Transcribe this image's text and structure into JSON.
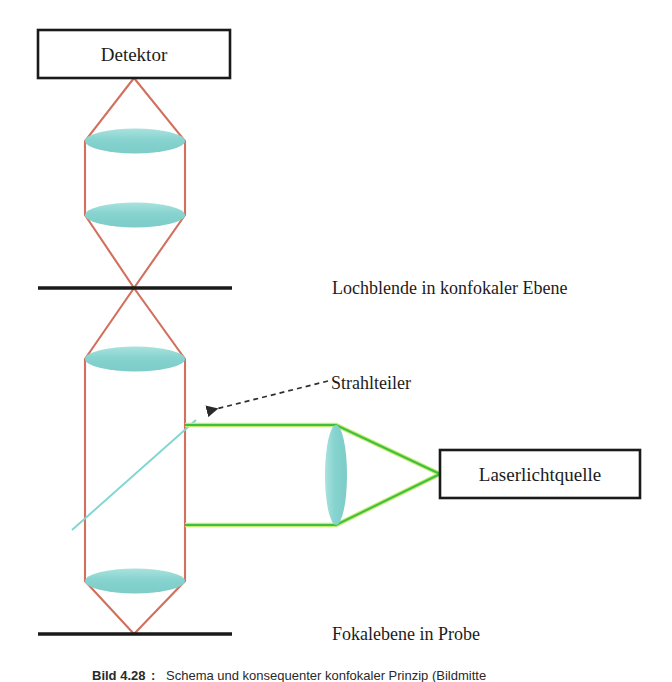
{
  "figure": {
    "title_alt": "Schema eines konfokalen Strahlengangs",
    "width": 672,
    "height": 682,
    "background": "#ffffff"
  },
  "colors": {
    "beam_detection": "#d2705e",
    "beam_illumination": "#3fbf3f",
    "beam_highlight": "#bde86a",
    "lens_fill": "#86d3cf",
    "lens_fill_light": "#a6e0dc",
    "beamsplitter": "#7fd6d2",
    "plane_line": "#1a1a1a",
    "box_stroke": "#1a1a1a",
    "leader_line": "#3a3a3a",
    "text": "#1c1c1c"
  },
  "boxes": [
    {
      "id": "detektor",
      "label": "Detektor",
      "x": 38,
      "y": 30,
      "width": 192,
      "height": 48
    },
    {
      "id": "laserlichtquelle",
      "label": "Laserlichtquelle",
      "x": 440,
      "y": 450,
      "width": 200,
      "height": 48
    }
  ],
  "planes": [
    {
      "id": "pinhole-plane",
      "label": "Lochblende in konfokaler Ebene",
      "x1": 38,
      "x2": 232,
      "y": 288,
      "label_x": 332,
      "label_y": 294
    },
    {
      "id": "focal-plane",
      "label": "Fokalebene in Probe",
      "x1": 38,
      "x2": 232,
      "y": 634,
      "label_x": 332,
      "label_y": 640
    }
  ],
  "annotations": [
    {
      "id": "beamsplitter-callout",
      "label": "Strahlteiler",
      "label_x": 332,
      "label_y": 388,
      "leader_from_x": 328,
      "leader_from_y": 383,
      "leader_to_x": 202,
      "leader_to_y": 412,
      "style": "dashed-arrow"
    }
  ],
  "lenses": [
    {
      "id": "detection-lens-upper",
      "orientation": "horizontal",
      "cx": 135,
      "cy": 141,
      "rx": 50,
      "ry": 12
    },
    {
      "id": "detection-lens-lower",
      "orientation": "horizontal",
      "cx": 135,
      "cy": 215,
      "rx": 50,
      "ry": 12
    },
    {
      "id": "objective-lens-upper",
      "orientation": "horizontal",
      "cx": 135,
      "cy": 359,
      "rx": 50,
      "ry": 12
    },
    {
      "id": "objective-lens-lower",
      "orientation": "horizontal",
      "cx": 135,
      "cy": 581,
      "rx": 50,
      "ry": 12
    },
    {
      "id": "collimating-lens",
      "orientation": "vertical",
      "cx": 336,
      "cy": 475,
      "rx": 11,
      "ry": 50
    }
  ],
  "beam_paths": {
    "detection": {
      "color_key": "beam_detection",
      "description": "Roter Detektionsstrahlengang vom Fokus in der Probe zum Detektor",
      "polylines": [
        "134,78 85,141 85,215 134,288 85,359 85,581 134,634",
        "134,78 185,141 185,215 134,288 185,359 185,581 134,634"
      ]
    },
    "illumination": {
      "color_key": "beam_illumination",
      "description": "Gruener Beleuchtungsstrahlengang von der Laserlichtquelle zum Strahlteiler",
      "polylines": [
        "440,474 336,425 185,425",
        "440,474 336,525 185,525"
      ]
    },
    "beamsplitter_line": {
      "color_key": "beamsplitter",
      "description": "Strahlteiler als diagonale Linie im Detektionsstrahlengang",
      "x1": 72,
      "y1": 530,
      "x2": 196,
      "y2": 420
    }
  },
  "caption": {
    "number": "Bild 4.28",
    "separator": ":",
    "text": "Schema und konsequenter konfokaler Prinzip (Bildmitte",
    "truncated": true
  }
}
